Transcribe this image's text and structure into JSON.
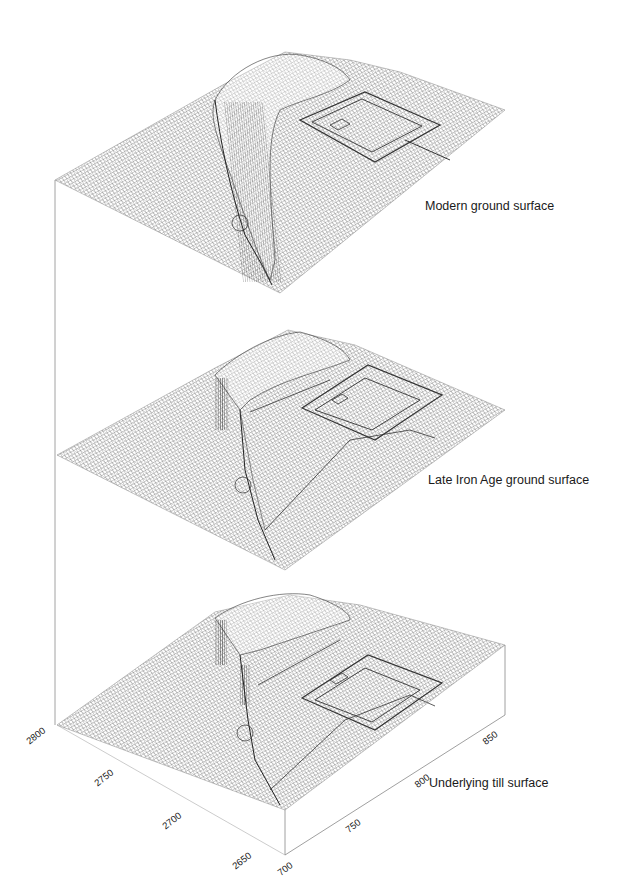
{
  "figure": {
    "type": "stacked 3D wireframe terrain surfaces",
    "surfaces": [
      {
        "id": "modern",
        "label": "Modern ground surface"
      },
      {
        "id": "late_iron_age",
        "label": "Late Iron Age ground surface"
      },
      {
        "id": "till",
        "label": "Underlying till surface"
      }
    ],
    "axes": {
      "left_axis_ticks": [
        "2800",
        "2750",
        "2700",
        "2650"
      ],
      "right_axis_ticks": [
        "700",
        "750",
        "800",
        "850"
      ]
    },
    "colors": {
      "mesh": "#5a5a5a",
      "mesh_dark": "#2a2a2a",
      "frame": "#777777",
      "background": "#ffffff",
      "text": "#1a1a1a"
    }
  }
}
